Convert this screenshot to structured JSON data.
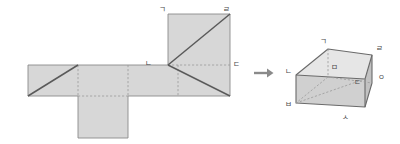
{
  "figure": {
    "title_visible": false,
    "background_color": "#ffffff",
    "face_fill": "#d4d4d4",
    "face_fill_light": "#dcdcdc",
    "face_fill_dark": "#c2c2c2",
    "face_fill_top": "#e4e4e4",
    "solid_edge_color": "#555555",
    "dashed_edge_color": "#8e8e8e",
    "outline_color": "#7a7a7a",
    "label_color": "#4a4a4a",
    "arrow_color": "#8a8a8a"
  },
  "net": {
    "name": "net-of-rectangular-prism",
    "description_visible": false,
    "labels": [
      {
        "id": "net-label-giyeok",
        "text": "ㄱ",
        "x": 162,
        "y": 10
      },
      {
        "id": "net-label-rieul",
        "text": "ㄹ",
        "x": 226,
        "y": 10
      },
      {
        "id": "net-label-nieun",
        "text": "ㄴ",
        "x": 148,
        "y": 64
      },
      {
        "id": "net-label-digeut",
        "text": "ㄷ",
        "x": 228,
        "y": 65
      }
    ],
    "panels": [
      {
        "id": "net-panel-left-square",
        "x": 28,
        "y": 65,
        "w": 50,
        "h": 31
      },
      {
        "id": "net-panel-second",
        "x": 78,
        "y": 65,
        "w": 50,
        "h": 31
      },
      {
        "id": "net-panel-third",
        "x": 128,
        "y": 65,
        "w": 50,
        "h": 31
      },
      {
        "id": "net-panel-fourth",
        "x": 178,
        "y": 65,
        "w": 52,
        "h": 31
      },
      {
        "id": "net-panel-bottom-flap",
        "x": 78,
        "y": 96,
        "w": 50,
        "h": 42
      },
      {
        "id": "net-panel-top-square",
        "x": 168,
        "y": 14,
        "w": 62,
        "h": 51
      }
    ]
  },
  "arrow": {
    "id": "transform-arrow",
    "glyph": "→",
    "x": 262,
    "y": 73
  },
  "solid": {
    "name": "rectangular-prism-3d",
    "labels": [
      {
        "id": "solid-label-giyeok",
        "text": "ㄱ",
        "x": 319,
        "y": 42
      },
      {
        "id": "solid-label-rieul",
        "text": "ㄹ",
        "x": 377,
        "y": 49
      },
      {
        "id": "solid-label-nieun",
        "text": "ㄴ",
        "x": 286,
        "y": 74
      },
      {
        "id": "solid-label-mieum",
        "text": "ㅁ",
        "x": 334,
        "y": 68
      },
      {
        "id": "solid-label-ieung",
        "text": "ㅇ",
        "x": 378,
        "y": 78
      },
      {
        "id": "solid-label-digeut",
        "text": "ㄷ",
        "x": 358,
        "y": 81
      },
      {
        "id": "solid-label-bieup",
        "text": "ㅂ",
        "x": 286,
        "y": 105
      },
      {
        "id": "solid-label-siot",
        "text": "ㅅ",
        "x": 345,
        "y": 116
      }
    ],
    "vertices": {
      "top_back_left": [
        328,
        49
      ],
      "top_back_right": [
        372,
        55
      ],
      "top_front_left": [
        296,
        75
      ],
      "top_front_right": [
        365,
        79
      ],
      "bottom_front_left": [
        296,
        103
      ],
      "bottom_front_right": [
        365,
        107
      ],
      "bottom_back_right": [
        372,
        83
      ],
      "bottom_back_left": [
        328,
        77
      ]
    }
  }
}
